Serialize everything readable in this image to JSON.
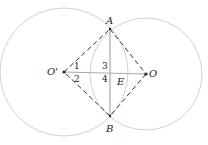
{
  "diagram": {
    "points": {
      "A": "A",
      "B": "B",
      "O": "O",
      "O_prime": "O'",
      "E": "E"
    },
    "angles": [
      "1",
      "2",
      "3",
      "4"
    ],
    "colors": {
      "circle": "#d0d0d0",
      "solid_line": "#a9a9a9",
      "dashed_line": "#333333",
      "text": "#222222"
    },
    "shapes": [
      {
        "type": "circle",
        "center": "O'",
        "cx": 64,
        "cy": 72,
        "r": 64
      },
      {
        "type": "circle",
        "center": "O",
        "cx": 146,
        "cy": 74,
        "r": 56
      },
      {
        "type": "segment",
        "from": "A",
        "to": "B",
        "style": "solid"
      },
      {
        "type": "segment",
        "from": "O'",
        "to": "O",
        "style": "solid"
      },
      {
        "type": "segment",
        "from": "O'",
        "to": "A",
        "style": "dashed"
      },
      {
        "type": "segment",
        "from": "A",
        "to": "O",
        "style": "dashed"
      },
      {
        "type": "segment",
        "from": "O",
        "to": "B",
        "style": "dashed"
      },
      {
        "type": "segment",
        "from": "B",
        "to": "O'",
        "style": "dashed"
      }
    ]
  }
}
